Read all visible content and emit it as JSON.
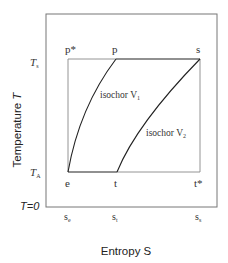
{
  "diagram": {
    "title": "",
    "x_axis_label": "Entropy S",
    "y_axis_label_prefix": "Temperature ",
    "y_axis_label_var": "T",
    "y_ticks": {
      "T_s": {
        "main": "T",
        "sub": "s"
      },
      "T_A": {
        "main": "T",
        "sub": "A"
      },
      "T_zero": "T=0"
    },
    "x_ticks": {
      "s_e": {
        "main": "s",
        "sub": "e"
      },
      "s_t": {
        "main": "s",
        "sub": "t"
      },
      "s_s": {
        "main": "s",
        "sub": "s"
      }
    },
    "points": {
      "p_star": "p*",
      "p": "p",
      "s": "s",
      "e": "e",
      "t": "t",
      "t_star": "t*"
    },
    "curves": {
      "isochor_1": {
        "main": "isochor V",
        "sub": "1"
      },
      "isochor_2": {
        "main": "isochor V",
        "sub": "2"
      }
    },
    "colors": {
      "frame": "#777777",
      "lines": "#222222",
      "background": "#ffffff"
    }
  }
}
